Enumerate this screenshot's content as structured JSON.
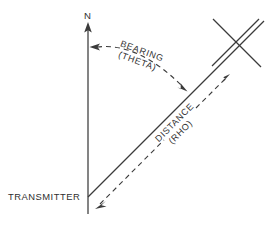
{
  "figure": {
    "background_color": "#ffffff",
    "line_color": "#3b3b3b",
    "text_color": "#2f2f2f",
    "width": 276,
    "height": 228
  },
  "labels": {
    "north": "N",
    "transmitter": "TRANSMITTER",
    "bearing_line1": "BEARING",
    "bearing_line2": "(THETA)",
    "distance_line1": "DISTANCE",
    "distance_line2": "(RHO)"
  },
  "geometry": {
    "origin_x": 88,
    "origin_y": 197,
    "north_tip_y": 24,
    "bearing_ray_end_x": 262,
    "bearing_ray_end_y": 23,
    "target_cross_x": 238,
    "target_cross_y": 42,
    "arc_start_x": 92,
    "arc_start_y": 47,
    "arc_end_x": 186,
    "arc_end_y": 90
  }
}
